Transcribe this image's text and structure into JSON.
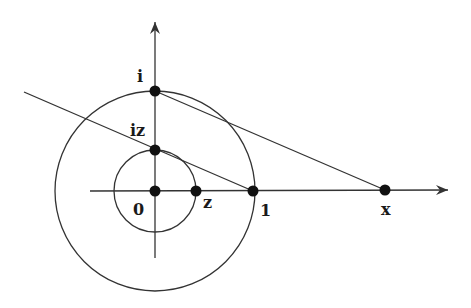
{
  "diagram": {
    "colors": {
      "ink": "#1a1a1a",
      "line": "#333333",
      "background": "#ffffff"
    },
    "axes": {
      "horizontal": {
        "x1": 90,
        "y1": 191,
        "x2": 448,
        "y2": 190,
        "arrow": true
      },
      "vertical": {
        "x1": 155,
        "y1": 258,
        "x2": 155,
        "y2": 22,
        "arrow": true
      }
    },
    "circles": [
      {
        "name": "unit-circle",
        "cx": 155,
        "cy": 191,
        "r": 100
      },
      {
        "name": "inner-circle",
        "cx": 155,
        "cy": 191,
        "r": 41
      }
    ],
    "lines": [
      {
        "name": "line-through-iz-and-1",
        "x1": 24,
        "y1": 92,
        "x2": 253,
        "y2": 191
      },
      {
        "name": "line-i-to-x",
        "x1": 155,
        "y1": 91,
        "x2": 385,
        "y2": 190
      }
    ],
    "points": [
      {
        "name": "point-i",
        "label": "i",
        "cx": 155,
        "cy": 91,
        "lx": 137,
        "ly": 82
      },
      {
        "name": "point-iz",
        "label": "iz",
        "cx": 155,
        "cy": 150,
        "lx": 130,
        "ly": 136
      },
      {
        "name": "point-origin",
        "label": "0",
        "cx": 155,
        "cy": 191,
        "lx": 133,
        "ly": 215
      },
      {
        "name": "point-z",
        "label": "z",
        "cx": 196,
        "cy": 191,
        "lx": 203,
        "ly": 208
      },
      {
        "name": "point-one",
        "label": "1",
        "cx": 253,
        "cy": 191,
        "lx": 260,
        "ly": 216
      },
      {
        "name": "point-x",
        "label": "x",
        "cx": 385,
        "cy": 190,
        "lx": 381,
        "ly": 215
      }
    ]
  }
}
